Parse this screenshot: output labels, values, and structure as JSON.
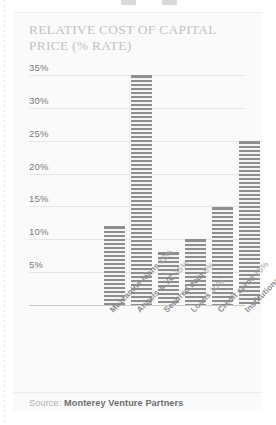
{
  "figure": {
    "title": "Relative cost of capital\nprice (% rate)",
    "source_label": "Source:",
    "source_name": "Monterey Venture Partners"
  },
  "chart_data": {
    "type": "bar",
    "title": "RELATIVE COST OF CAPITAL PRICE (% RATE)",
    "xlabel": "",
    "ylabel": "",
    "ylim": [
      0,
      37
    ],
    "grid": true,
    "legend": "none",
    "yticks": [
      5,
      10,
      15,
      20,
      25,
      30,
      35
    ],
    "ytick_labels": [
      "5%",
      "10%",
      "15%",
      "20%",
      "25%",
      "30%",
      "35%"
    ],
    "categories": [
      "Mezzanine loans",
      "Angels & VC",
      "Secured debt",
      "Loans",
      "Credit cards",
      "Institutional equity"
    ],
    "values": [
      12,
      35,
      8,
      10,
      15,
      25
    ],
    "category_labels": [
      "Mezzanine loans 12%",
      "Angels & VC 35%",
      "Secured debt 8%",
      "Loans 10%",
      "Credit cards 15%",
      "Institutional equity 25%"
    ],
    "value_labels": [
      "12%",
      "35%",
      "8%",
      "10%",
      "15%",
      "25%"
    ],
    "bar_fill": "#8e8e8e",
    "bar_pattern": "horizontal-stripes",
    "source": "Source: Monterey Venture Partners"
  }
}
